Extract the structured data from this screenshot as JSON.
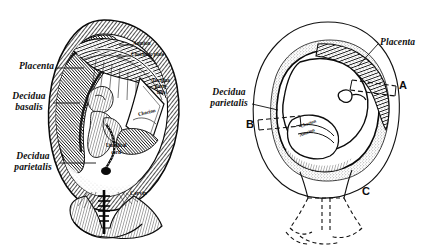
{
  "figure": {
    "type": "anatomical-engraving",
    "background_color": "#ffffff",
    "ink_color": "#0d0d0d",
    "panel_count": 2
  },
  "left_panel": {
    "name": "sagittal-section-pregnant-uterus",
    "labels": {
      "placenta": "Placenta",
      "decidua_basalis_line1": "Decidua",
      "decidua_basalis_line2": "basalis",
      "decidua_parietalis_line1": "Decidua",
      "decidua_parietalis_line2": "parietalis",
      "amnion": "Amnion",
      "chorionic_plate": "Chorionic plate",
      "decidua_parietalis_inset_line1": "Decidua",
      "decidua_parietalis_inset_line2": "parie-",
      "decidua_parietalis_inset_line3": "talis",
      "chorion": "Chorion",
      "umbilical_cord_line1": "Umbilical",
      "umbilical_cord_line2": "cord",
      "cervix": "Cervix"
    }
  },
  "right_panel": {
    "name": "schematic-section-pregnant-uterus",
    "labels": {
      "placenta": "Placenta",
      "decidua_parietalis_line1": "Decidua",
      "decidua_parietalis_line2": "parietalis",
      "chorion": "Chorion",
      "amnion": "Amnion"
    },
    "markers": {
      "a": "A",
      "b": "B",
      "c": "C"
    }
  }
}
